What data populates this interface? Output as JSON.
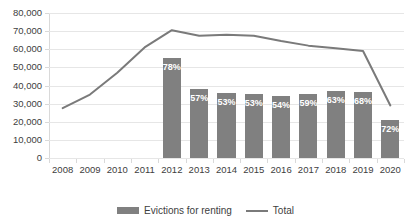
{
  "chart_data": {
    "type": "bar",
    "title": "",
    "subtitle": "",
    "xlabel": "",
    "ylabel": "",
    "ylim": [
      0,
      80000
    ],
    "ytick_step": 10000,
    "grid": true,
    "legend_position": "bottom",
    "categories": [
      "2008",
      "2009",
      "2010",
      "2011",
      "2012",
      "2013",
      "2014",
      "2015",
      "2016",
      "2017",
      "2018",
      "2019",
      "2020"
    ],
    "ytick_labels": [
      "0",
      "10,000",
      "20,000",
      "30,000",
      "40,000",
      "50,000",
      "60,000",
      "70,000",
      "80,000"
    ],
    "ytick_values": [
      0,
      10000,
      20000,
      30000,
      40000,
      50000,
      60000,
      70000,
      80000
    ],
    "series": [
      {
        "name": "Evictions for renting",
        "type": "bar",
        "color": "#808080",
        "values": [
          null,
          null,
          null,
          null,
          55000,
          38000,
          36000,
          35500,
          34000,
          35500,
          37000,
          36500,
          21000
        ],
        "data_labels": [
          null,
          null,
          null,
          null,
          "78%",
          "57%",
          "53%",
          "53%",
          "54%",
          "59%",
          "63%",
          "68%",
          "72%"
        ]
      },
      {
        "name": "Total",
        "type": "line",
        "color": "#7a7a7a",
        "values": [
          27500,
          35000,
          47000,
          61000,
          70500,
          67500,
          68000,
          67500,
          64500,
          62000,
          60500,
          59000,
          29000
        ]
      }
    ]
  },
  "legend": {
    "items": [
      {
        "label": "Evictions for renting",
        "marker": "bar-swatch",
        "color": "#808080"
      },
      {
        "label": "Total",
        "marker": "line-swatch",
        "color": "#7a7a7a"
      }
    ]
  },
  "colors": {
    "bar": "#808080",
    "line": "#7a7a7a",
    "gridline": "#e6e6e6",
    "axis": "#d9d9d9",
    "text": "#404040",
    "bar_label_text": "#ffffff",
    "background": "#ffffff"
  }
}
